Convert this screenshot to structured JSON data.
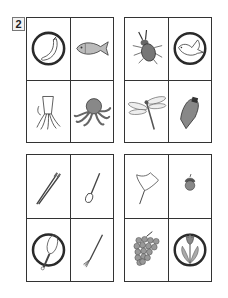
{
  "worksheet": {
    "question_number": "2",
    "instruction_hint": "Odd one out circled in each group",
    "groups": [
      {
        "id": "group-1",
        "category": "sea creatures",
        "items": [
          {
            "name": "banana",
            "circled": true
          },
          {
            "name": "fish",
            "circled": false
          },
          {
            "name": "squid",
            "circled": false
          },
          {
            "name": "octopus",
            "circled": false
          }
        ]
      },
      {
        "id": "group-2",
        "category": "insects",
        "items": [
          {
            "name": "stag beetle",
            "circled": false
          },
          {
            "name": "bird",
            "circled": true
          },
          {
            "name": "dragonfly",
            "circled": false
          },
          {
            "name": "cicada",
            "circled": false
          }
        ]
      },
      {
        "id": "group-3",
        "category": "eating utensils",
        "items": [
          {
            "name": "chopsticks",
            "circled": false
          },
          {
            "name": "spoon",
            "circled": false
          },
          {
            "name": "whisk",
            "circled": true
          },
          {
            "name": "fork",
            "circled": false
          }
        ]
      },
      {
        "id": "group-4",
        "category": "autumn things",
        "items": [
          {
            "name": "ginkgo leaf",
            "circled": false
          },
          {
            "name": "acorn",
            "circled": false
          },
          {
            "name": "grapes",
            "circled": false
          },
          {
            "name": "tulip",
            "circled": true
          }
        ]
      }
    ],
    "colors": {
      "line": "#333333",
      "circle": "#2a2a2a",
      "fill_gray": "#8a8a8a",
      "background": "#ffffff"
    }
  }
}
